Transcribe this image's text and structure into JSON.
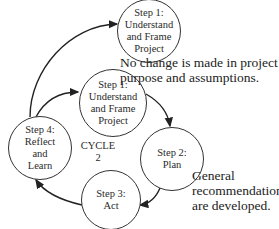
{
  "diagram": {
    "type": "cycle",
    "cycle_label": {
      "line1": "CYCLE",
      "line2": "2"
    },
    "nodes": {
      "step1_next": {
        "lines": [
          "Step 1:",
          "Understand",
          "and Frame",
          "Project"
        ]
      },
      "step1": {
        "lines": [
          "Step 1:",
          "Understand",
          "and Frame",
          "Project"
        ]
      },
      "step2": {
        "lines": [
          "Step 2:",
          "Plan"
        ]
      },
      "step3": {
        "lines": [
          "Step 3:",
          "Act"
        ]
      },
      "step4": {
        "lines": [
          "Step 4:",
          "Reflect",
          "and",
          "Learn"
        ]
      }
    },
    "annotations": {
      "no_change": {
        "lines": [
          "No change is made in project",
          "purpose and assumptions."
        ]
      },
      "general": {
        "lines": [
          "General",
          "recommendations",
          "are developed."
        ]
      }
    },
    "edges": [
      {
        "from": "step1",
        "to": "step2"
      },
      {
        "from": "step2",
        "to": "step3"
      },
      {
        "from": "step3",
        "to": "step4"
      },
      {
        "from": "step4",
        "to": "step1"
      },
      {
        "from": "step4",
        "to": "step1_next"
      }
    ]
  }
}
